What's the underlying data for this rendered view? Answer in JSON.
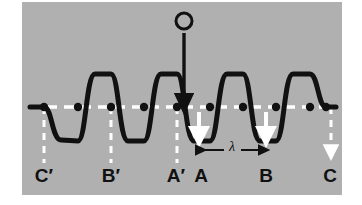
{
  "figure": {
    "background_color": "#ffffff",
    "panel_color": "#b0b0b0",
    "wave_color": "#111111",
    "guide_color": "#ffffff",
    "label_color": "#111111",
    "panel": {
      "x": 22,
      "y": 2,
      "width": 320,
      "height": 193
    }
  },
  "source": {
    "marker_label": "O",
    "marker_name": "source-point-o",
    "arrow_name": "source-direction-arrow",
    "arrow_description": "downward arrow from O to axis",
    "x": 184,
    "circle_cy": 21,
    "circle_r": 8,
    "arrow_y_start": 33,
    "arrow_y_end": 108
  },
  "axis": {
    "name": "equilibrium-axis",
    "y": 107,
    "x_start": 30,
    "x_end": 336,
    "style": "dashed",
    "color": "#ffffff"
  },
  "wavelength": {
    "symbol": "λ",
    "x_start": 199,
    "x_end": 266,
    "y": 150,
    "label_x": 232,
    "label_y": 147
  },
  "markers": [
    {
      "id": "C-prime",
      "label": "C′",
      "x": 44,
      "label_x": 44,
      "label_y": 182,
      "guide": "dashed-line",
      "guide_bottom": 163,
      "arrowhead": false
    },
    {
      "id": "B-prime",
      "label": "B′",
      "x": 111,
      "label_x": 111,
      "label_y": 182,
      "guide": "dashed-line",
      "guide_bottom": 163,
      "arrowhead": false
    },
    {
      "id": "A-prime",
      "label": "A′",
      "x": 177,
      "label_x": 176,
      "label_y": 182,
      "guide": "dashed-line",
      "guide_bottom": 163,
      "arrowhead": false
    },
    {
      "id": "A",
      "label": "A",
      "x": 199,
      "label_x": 201,
      "label_y": 182,
      "guide": "velocity-arrow",
      "guide_bottom": 140,
      "arrowhead": true
    },
    {
      "id": "B",
      "label": "B",
      "x": 266,
      "label_x": 266,
      "label_y": 182,
      "guide": "velocity-arrow",
      "guide_bottom": 140,
      "arrowhead": true
    },
    {
      "id": "C",
      "label": "C",
      "x": 332,
      "label_x": 330,
      "label_y": 182,
      "guide": "dashed-arrow",
      "guide_bottom": 155,
      "arrowhead": true
    }
  ],
  "wave": {
    "name": "transverse-waveform",
    "path": "M 30 107 L 44 107 C 52 107 52 140 61 140 C 70 140 70 141 78 141 C 86 141 86 74 95 74 C 103 74 103 74 111 74 C 119 74 119 141 128 141 C 136 141 136 141 144 141 C 152 141 152 74 161 74 C 169 74 169 74 177 74 C 185 74 185 141 194 141 C 202 141 202 141 210 141 C 218 141 218 74 227 74 C 235 74 235 74 243 74 C 251 74 251 141 260 141 C 268 141 268 141 276 141 C 284 141 284 74 293 74 C 301 74 301 74 310 74 C 318 74 318 107 326 107 L 336 107",
    "stroke_width": 5,
    "crest_y": 74,
    "trough_y": 141,
    "amplitude": 34
  },
  "node_dots": [
    {
      "x": 44,
      "y": 107
    },
    {
      "x": 78,
      "y": 107
    },
    {
      "x": 111,
      "y": 107
    },
    {
      "x": 144,
      "y": 107
    },
    {
      "x": 177,
      "y": 107
    },
    {
      "x": 210,
      "y": 107
    },
    {
      "x": 243,
      "y": 107
    },
    {
      "x": 276,
      "y": 107
    },
    {
      "x": 310,
      "y": 107
    },
    {
      "x": 326,
      "y": 107
    }
  ]
}
